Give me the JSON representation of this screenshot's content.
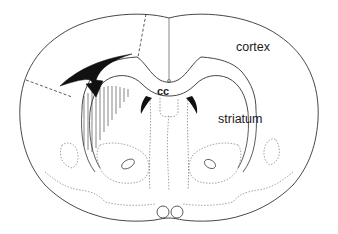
{
  "figure": {
    "type": "coronal brain section schematic",
    "labels": {
      "cortex": "cortex",
      "striatum": "striatum",
      "corpus_callosum": "cc"
    },
    "annotations": {
      "arrow": "black curved arrow pointing into hatched region of left striatum",
      "hatched_region": "vertical line hatching over left striatum",
      "dashed_lines": "two dashed lines in left hemisphere cortex demarcating region"
    },
    "colors": {
      "line": "#333333",
      "fill_black": "#111111",
      "background": "#ffffff"
    }
  }
}
